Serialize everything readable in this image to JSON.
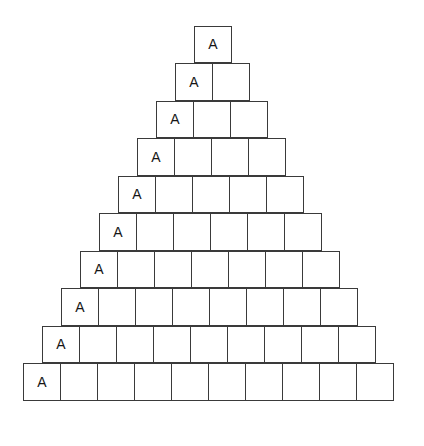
{
  "figure": {
    "name": "block-pyramid",
    "background_color": "#ffffff",
    "block_border_color": "#3a3a3a",
    "block_fill_color": "#ffffff",
    "label_color": "#161616",
    "block_width_px": 38,
    "block_height_px": 37.5,
    "left_origin_px": 23,
    "top_origin_px": 25.5
  },
  "chart_data": {
    "type": "diagram",
    "title": "",
    "rows_total": 10,
    "label_text": "A",
    "row_counts": [
      1,
      2,
      3,
      4,
      5,
      6,
      7,
      8,
      9,
      10
    ],
    "rows": [
      {
        "index": 1,
        "count": 1,
        "label": "A",
        "labeled_cell": 1,
        "cells": [
          "A"
        ]
      },
      {
        "index": 2,
        "count": 2,
        "label": "A",
        "labeled_cell": 1,
        "cells": [
          "A",
          ""
        ]
      },
      {
        "index": 3,
        "count": 3,
        "label": "A",
        "labeled_cell": 1,
        "cells": [
          "A",
          "",
          ""
        ]
      },
      {
        "index": 4,
        "count": 4,
        "label": "A",
        "labeled_cell": 1,
        "cells": [
          "A",
          "",
          "",
          ""
        ]
      },
      {
        "index": 5,
        "count": 5,
        "label": "A",
        "labeled_cell": 1,
        "cells": [
          "A",
          "",
          "",
          "",
          ""
        ]
      },
      {
        "index": 6,
        "count": 6,
        "label": "A",
        "labeled_cell": 1,
        "cells": [
          "A",
          "",
          "",
          "",
          "",
          ""
        ]
      },
      {
        "index": 7,
        "count": 7,
        "label": "A",
        "labeled_cell": 1,
        "cells": [
          "A",
          "",
          "",
          "",
          "",
          "",
          ""
        ]
      },
      {
        "index": 8,
        "count": 8,
        "label": "A",
        "labeled_cell": 1,
        "cells": [
          "A",
          "",
          "",
          "",
          "",
          "",
          "",
          ""
        ]
      },
      {
        "index": 9,
        "count": 9,
        "label": "A",
        "labeled_cell": 1,
        "cells": [
          "A",
          "",
          "",
          "",
          "",
          "",
          "",
          "",
          ""
        ]
      },
      {
        "index": 10,
        "count": 10,
        "label": "A",
        "labeled_cell": 1,
        "cells": [
          "A",
          "",
          "",
          "",
          "",
          "",
          "",
          "",
          "",
          ""
        ]
      }
    ]
  }
}
